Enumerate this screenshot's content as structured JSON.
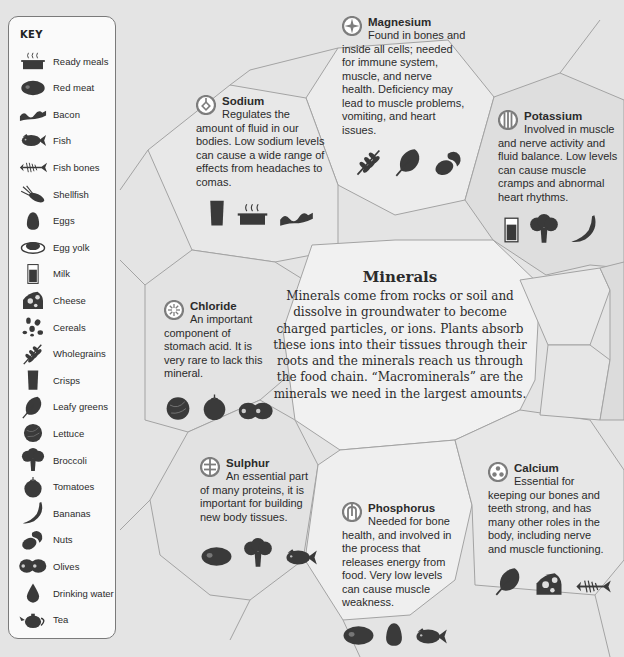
{
  "key": {
    "title": "KEY",
    "items": [
      {
        "icon": "ready-meals-icon",
        "label": "Ready meals"
      },
      {
        "icon": "red-meat-icon",
        "label": "Red meat"
      },
      {
        "icon": "bacon-icon",
        "label": "Bacon"
      },
      {
        "icon": "fish-icon",
        "label": "Fish"
      },
      {
        "icon": "fish-bones-icon",
        "label": "Fish bones"
      },
      {
        "icon": "shellfish-icon",
        "label": "Shellfish"
      },
      {
        "icon": "eggs-icon",
        "label": "Eggs"
      },
      {
        "icon": "egg-yolk-icon",
        "label": "Egg yolk"
      },
      {
        "icon": "milk-icon",
        "label": "Milk"
      },
      {
        "icon": "cheese-icon",
        "label": "Cheese"
      },
      {
        "icon": "cereals-icon",
        "label": "Cereals"
      },
      {
        "icon": "wholegrains-icon",
        "label": "Wholegrains"
      },
      {
        "icon": "crisps-icon",
        "label": "Crisps"
      },
      {
        "icon": "leafy-greens-icon",
        "label": "Leafy greens"
      },
      {
        "icon": "lettuce-icon",
        "label": "Lettuce"
      },
      {
        "icon": "broccoli-icon",
        "label": "Broccoli"
      },
      {
        "icon": "tomatoes-icon",
        "label": "Tomatoes"
      },
      {
        "icon": "bananas-icon",
        "label": "Bananas"
      },
      {
        "icon": "nuts-icon",
        "label": "Nuts"
      },
      {
        "icon": "olives-icon",
        "label": "Olives"
      },
      {
        "icon": "drinking-water-icon",
        "label": "Drinking water"
      },
      {
        "icon": "tea-icon",
        "label": "Tea"
      }
    ]
  },
  "center": {
    "title": "Minerals",
    "body": "Minerals come from rocks or soil and dissolve in groundwater to become charged particles, or ions. Plants absorb these ions into their tissues through their roots and the minerals reach us through the food chain. “Macrominerals” are the minerals we need in the largest amounts."
  },
  "minerals": {
    "sodium": {
      "name": "Sodium",
      "badge": "sodium-symbol-icon",
      "text": "Regulates the amount of fluid in our bodies. Low sodium levels can cause a wide range of effects from headaches to comas.",
      "foods": [
        "crisps",
        "ready-meals",
        "bacon"
      ]
    },
    "magnesium": {
      "name": "Magnesium",
      "badge": "magnesium-symbol-icon",
      "text": "Found in bones and inside all cells; needed for immune system, muscle, and nerve health. Deficiency may lead to muscle problems, vomiting, and heart issues.",
      "foods": [
        "wholegrains",
        "leafy-greens",
        "nuts"
      ]
    },
    "potassium": {
      "name": "Potassium",
      "badge": "potassium-symbol-icon",
      "text": "Involved in muscle and nerve activity and fluid balance. Low levels can cause muscle cramps and abnormal heart rhythms.",
      "foods": [
        "milk",
        "broccoli",
        "bananas"
      ]
    },
    "chloride": {
      "name": "Chloride",
      "badge": "chloride-symbol-icon",
      "text": "An important component of stomach acid. It is very rare to lack this mineral.",
      "foods": [
        "lettuce",
        "tomatoes",
        "olives"
      ]
    },
    "sulphur": {
      "name": "Sulphur",
      "badge": "sulphur-symbol-icon",
      "text": "An essential part of many proteins, it is important for building new body tissues.",
      "foods": [
        "red-meat",
        "broccoli",
        "fish"
      ]
    },
    "phosphorus": {
      "name": "Phosphorus",
      "badge": "phosphorus-symbol-icon",
      "text": "Needed for bone health, and involved in the process that releases energy from food. Very low levels can cause muscle weakness.",
      "foods": [
        "red-meat",
        "eggs",
        "fish"
      ]
    },
    "calcium": {
      "name": "Calcium",
      "badge": "calcium-symbol-icon",
      "text": "Essential for keeping our bones and teeth strong, and has many other roles in the body, including nerve and muscle functioning.",
      "foods": [
        "leafy-greens",
        "cheese",
        "fish-bones"
      ]
    }
  },
  "colors": {
    "background": "#e4e4e4",
    "cell_light": "#efefef",
    "cell_mid": "#e2e2e2",
    "cell_dark": "#d6d6d6",
    "cell_edge": "#9a9a9a",
    "icon": "#3a3a3a",
    "badge_ring": "#7d7d7d"
  }
}
